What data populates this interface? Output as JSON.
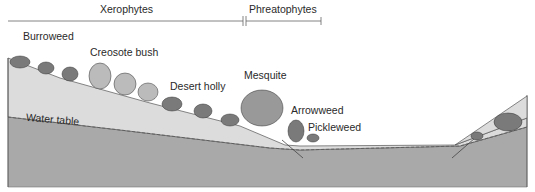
{
  "header": {
    "xerophytes_label": "Xerophytes",
    "phreatophytes_label": "Phreatophytes"
  },
  "plants": [
    {
      "name": "Burroweed"
    },
    {
      "name": "Creosote bush"
    },
    {
      "name": "Desert holly"
    },
    {
      "name": "Mesquite"
    },
    {
      "name": "Arrowweed"
    },
    {
      "name": "Pickleweed"
    }
  ],
  "ground": {
    "water_table_label": "Water table"
  },
  "colors": {
    "unsaturated_soil": "#dcdcdc",
    "saturated_zone": "#a9a9a9",
    "line": "#555555",
    "text": "#2a2a2a"
  }
}
